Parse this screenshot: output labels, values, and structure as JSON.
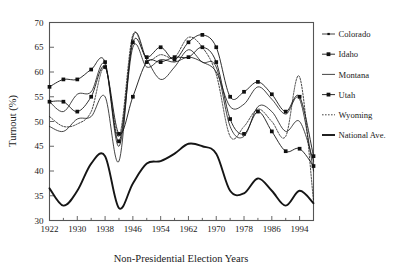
{
  "chart_data": {
    "type": "line",
    "title": "",
    "xlabel": "Non-Presidential Election Years",
    "ylabel": "Turnout (%)",
    "xlim": [
      1922,
      1998
    ],
    "ylim": [
      30,
      70
    ],
    "grid": false,
    "legend_position": "right",
    "x_tick_labels": [
      "1922",
      "1930",
      "1938",
      "1946",
      "1954",
      "1962",
      "1970",
      "1978",
      "1986",
      "1994"
    ],
    "x_tick_values": [
      1922,
      1930,
      1938,
      1946,
      1954,
      1962,
      1970,
      1978,
      1986,
      1994
    ],
    "x_minor_tick_values": [
      1926,
      1934,
      1942,
      1950,
      1958,
      1966,
      1974,
      1982,
      1990,
      1998
    ],
    "y_tick_labels": [
      "30",
      "35",
      "40",
      "45",
      "50",
      "55",
      "60",
      "65",
      "70"
    ],
    "y_tick_values": [
      30,
      35,
      40,
      45,
      50,
      55,
      60,
      65,
      70
    ],
    "x": [
      1922,
      1926,
      1930,
      1934,
      1938,
      1942,
      1946,
      1950,
      1954,
      1958,
      1962,
      1966,
      1970,
      1974,
      1978,
      1982,
      1986,
      1990,
      1994,
      1998
    ],
    "series": [
      {
        "name": "Colorado",
        "marker": "tick",
        "line_style": "solid",
        "line_width": 0.8,
        "values": [
          49.0,
          48.0,
          50.5,
          51.0,
          55.0,
          42.0,
          67.0,
          62.5,
          58.5,
          61.0,
          64.5,
          62.0,
          61.0,
          49.0,
          47.0,
          53.0,
          52.0,
          48.0,
          50.0,
          42.0
        ]
      },
      {
        "name": "Idaho",
        "marker": "square",
        "line_style": "solid",
        "line_width": 0.9,
        "values": [
          57.0,
          58.5,
          58.5,
          60.5,
          62.0,
          46.0,
          66.0,
          63.0,
          65.0,
          62.5,
          66.0,
          67.5,
          65.0,
          55.0,
          56.0,
          58.0,
          55.5,
          52.0,
          55.0,
          43.0
        ]
      },
      {
        "name": "Montana",
        "marker": "none",
        "line_style": "solid",
        "line_width": 0.8,
        "values": [
          54.0,
          52.0,
          55.5,
          56.0,
          61.5,
          45.0,
          65.0,
          61.0,
          62.5,
          62.0,
          63.0,
          62.0,
          60.0,
          53.0,
          53.5,
          57.0,
          54.5,
          51.5,
          54.5,
          40.0
        ]
      },
      {
        "name": "Utah",
        "marker": "square",
        "line_style": "solid",
        "line_width": 0.9,
        "values": [
          54.0,
          54.0,
          52.0,
          55.0,
          61.0,
          47.5,
          55.0,
          62.0,
          62.0,
          63.0,
          63.0,
          65.0,
          62.0,
          50.5,
          47.5,
          52.0,
          48.0,
          44.0,
          44.5,
          41.0
        ]
      },
      {
        "name": "Wyoming",
        "marker": "none",
        "line_style": "dotted",
        "line_width": 0.8,
        "values": [
          51.0,
          49.0,
          49.5,
          52.0,
          61.0,
          47.0,
          67.5,
          62.5,
          63.5,
          63.0,
          67.0,
          65.0,
          59.5,
          47.0,
          49.0,
          52.5,
          50.0,
          47.0,
          59.0,
          34.0
        ]
      },
      {
        "name": "National Ave.",
        "marker": "none",
        "line_style": "solid",
        "line_width": 1.9,
        "values": [
          36.5,
          33.0,
          36.0,
          41.5,
          43.0,
          32.5,
          37.5,
          41.5,
          42.0,
          43.5,
          45.5,
          45.0,
          43.5,
          36.0,
          35.5,
          38.5,
          36.0,
          33.0,
          36.0,
          33.5
        ]
      }
    ]
  },
  "legend": {
    "items": [
      {
        "label": "Colorado"
      },
      {
        "label": "Idaho"
      },
      {
        "label": "Montana"
      },
      {
        "label": "Utah"
      },
      {
        "label": "Wyoming"
      },
      {
        "label": "National Ave."
      }
    ]
  },
  "colors": {
    "line": "#151515",
    "axis": "#555555",
    "background": "#ffffff",
    "text": "#1a1a1a"
  }
}
